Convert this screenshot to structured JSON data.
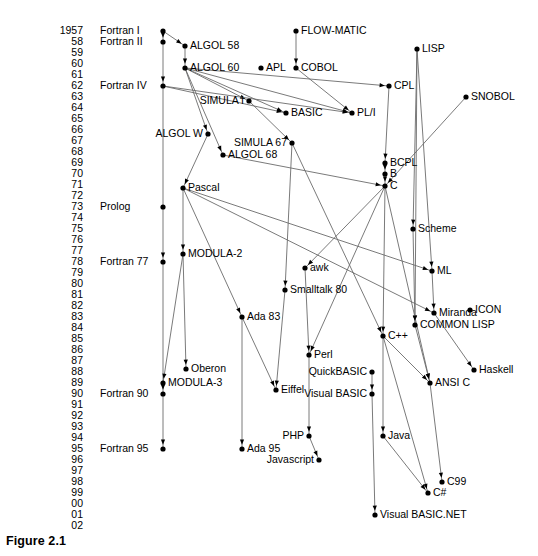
{
  "figure": {
    "caption": "Figure 2.1",
    "width": 538,
    "height": 556,
    "ink_color": "#000000",
    "line_color": "#6b6b6b",
    "background": "#ffffff"
  },
  "chart_data": {
    "type": "diagram",
    "title": "Figure 2.1",
    "subtype": "programming-language genealogy timeline",
    "ylabel": "Year",
    "years": [
      "1957",
      "58",
      "59",
      "60",
      "61",
      "62",
      "63",
      "64",
      "65",
      "66",
      "67",
      "68",
      "69",
      "70",
      "71",
      "72",
      "73",
      "74",
      "75",
      "76",
      "77",
      "78",
      "79",
      "80",
      "81",
      "82",
      "83",
      "84",
      "85",
      "86",
      "87",
      "88",
      "89",
      "90",
      "91",
      "92",
      "93",
      "94",
      "95",
      "96",
      "97",
      "98",
      "99",
      "00",
      "01",
      "02"
    ],
    "year_rows": [
      {
        "year": "1957",
        "y": 31
      },
      {
        "year": "58",
        "y": 42
      },
      {
        "year": "59",
        "y": 53
      },
      {
        "year": "60",
        "y": 64
      },
      {
        "year": "61",
        "y": 75
      },
      {
        "year": "62",
        "y": 86
      },
      {
        "year": "63",
        "y": 97
      },
      {
        "year": "64",
        "y": 108
      },
      {
        "year": "65",
        "y": 119
      },
      {
        "year": "66",
        "y": 130
      },
      {
        "year": "67",
        "y": 141
      },
      {
        "year": "68",
        "y": 152
      },
      {
        "year": "69",
        "y": 163
      },
      {
        "year": "70",
        "y": 174
      },
      {
        "year": "71",
        "y": 185
      },
      {
        "year": "72",
        "y": 196
      },
      {
        "year": "73",
        "y": 207
      },
      {
        "year": "74",
        "y": 218
      },
      {
        "year": "75",
        "y": 229
      },
      {
        "year": "76",
        "y": 240
      },
      {
        "year": "77",
        "y": 251
      },
      {
        "year": "78",
        "y": 262
      },
      {
        "year": "79",
        "y": 273
      },
      {
        "year": "80",
        "y": 284
      },
      {
        "year": "81",
        "y": 295
      },
      {
        "year": "82",
        "y": 306
      },
      {
        "year": "83",
        "y": 317
      },
      {
        "year": "84",
        "y": 328
      },
      {
        "year": "85",
        "y": 339
      },
      {
        "year": "86",
        "y": 350
      },
      {
        "year": "87",
        "y": 361
      },
      {
        "year": "88",
        "y": 372
      },
      {
        "year": "89",
        "y": 383
      },
      {
        "year": "90",
        "y": 394
      },
      {
        "year": "91",
        "y": 405
      },
      {
        "year": "92",
        "y": 416
      },
      {
        "year": "93",
        "y": 427
      },
      {
        "year": "94",
        "y": 438
      },
      {
        "year": "95",
        "y": 449
      },
      {
        "year": "96",
        "y": 460
      },
      {
        "year": "97",
        "y": 471
      },
      {
        "year": "98",
        "y": 482
      },
      {
        "year": "99",
        "y": 493
      },
      {
        "year": "00",
        "y": 504
      },
      {
        "year": "01",
        "y": 515
      },
      {
        "year": "02",
        "y": 526
      }
    ],
    "era_labels": [
      {
        "text": "Fortran I",
        "x": 100,
        "y": 31
      },
      {
        "text": "Fortran II",
        "x": 100,
        "y": 42
      },
      {
        "text": "Fortran IV",
        "x": 100,
        "y": 86
      },
      {
        "text": "Prolog",
        "x": 100,
        "y": 207
      },
      {
        "text": "Fortran 77",
        "x": 100,
        "y": 262
      },
      {
        "text": "Fortran 90",
        "x": 100,
        "y": 394
      },
      {
        "text": "Fortran 95",
        "x": 100,
        "y": 449
      }
    ],
    "nodes": [
      {
        "id": "fortran1",
        "label": "Fortran I",
        "x": 163,
        "y": 31,
        "label_pos": "none"
      },
      {
        "id": "fortran2",
        "label": "Fortran II",
        "x": 163,
        "y": 42,
        "label_pos": "none"
      },
      {
        "id": "fortran4",
        "label": "Fortran IV",
        "x": 163,
        "y": 86,
        "label_pos": "none"
      },
      {
        "id": "fortran77",
        "label": "Fortran 77",
        "x": 163,
        "y": 262,
        "label_pos": "none"
      },
      {
        "id": "fortran90",
        "label": "Fortran 90",
        "x": 163,
        "y": 394,
        "label_pos": "none"
      },
      {
        "id": "fortran95",
        "label": "Fortran 95",
        "x": 163,
        "y": 449,
        "label_pos": "none"
      },
      {
        "id": "algol58",
        "label": "ALGOL 58",
        "x": 185,
        "y": 46,
        "label_pos": "right"
      },
      {
        "id": "algol60",
        "label": "ALGOL 60",
        "x": 185,
        "y": 68,
        "label_pos": "right"
      },
      {
        "id": "apl",
        "label": "APL",
        "x": 261,
        "y": 68,
        "label_pos": "right"
      },
      {
        "id": "flowmatic",
        "label": "FLOW-MATIC",
        "x": 296,
        "y": 31,
        "label_pos": "right"
      },
      {
        "id": "cobol",
        "label": "COBOL",
        "x": 296,
        "y": 68,
        "label_pos": "right"
      },
      {
        "id": "lisp",
        "label": "LISP",
        "x": 417,
        "y": 49,
        "label_pos": "right"
      },
      {
        "id": "cpl",
        "label": "CPL",
        "x": 389,
        "y": 86,
        "label_pos": "right"
      },
      {
        "id": "snobol",
        "label": "SNOBOL",
        "x": 466,
        "y": 97,
        "label_pos": "right"
      },
      {
        "id": "simula1",
        "label": "SIMULA I",
        "x": 249,
        "y": 101,
        "label_pos": "left"
      },
      {
        "id": "basic",
        "label": "BASIC",
        "x": 286,
        "y": 113,
        "label_pos": "right"
      },
      {
        "id": "pli",
        "label": "PL/I",
        "x": 352,
        "y": 113,
        "label_pos": "right"
      },
      {
        "id": "algolw",
        "label": "ALGOL W",
        "x": 208,
        "y": 134,
        "label_pos": "left"
      },
      {
        "id": "simula67",
        "label": "SIMULA 67",
        "x": 292,
        "y": 143,
        "label_pos": "left"
      },
      {
        "id": "algol68",
        "label": "ALGOL 68",
        "x": 223,
        "y": 155,
        "label_pos": "right"
      },
      {
        "id": "bcpl",
        "label": "BCPL",
        "x": 385,
        "y": 163,
        "label_pos": "right"
      },
      {
        "id": "b",
        "label": "B",
        "x": 385,
        "y": 174,
        "label_pos": "right"
      },
      {
        "id": "c",
        "label": "C",
        "x": 385,
        "y": 186,
        "label_pos": "right"
      },
      {
        "id": "pascal",
        "label": "Pascal",
        "x": 183,
        "y": 188,
        "label_pos": "right"
      },
      {
        "id": "prolog",
        "label": "Prolog",
        "x": 163,
        "y": 207,
        "label_pos": "none"
      },
      {
        "id": "scheme",
        "label": "Scheme",
        "x": 413,
        "y": 229,
        "label_pos": "right"
      },
      {
        "id": "modula2",
        "label": "MODULA-2",
        "x": 183,
        "y": 254,
        "label_pos": "right"
      },
      {
        "id": "ml",
        "label": "ML",
        "x": 432,
        "y": 271,
        "label_pos": "right"
      },
      {
        "id": "awk",
        "label": "awk",
        "x": 305,
        "y": 268,
        "label_pos": "right"
      },
      {
        "id": "smalltalk",
        "label": "Smalltalk 80",
        "x": 285,
        "y": 290,
        "label_pos": "right"
      },
      {
        "id": "miranda",
        "label": "Miranda",
        "x": 434,
        "y": 313,
        "label_pos": "right"
      },
      {
        "id": "icon",
        "label": "ICON",
        "x": 470,
        "y": 310,
        "label_pos": "right"
      },
      {
        "id": "commonlisp",
        "label": "COMMON LISP",
        "x": 415,
        "y": 325,
        "label_pos": "right"
      },
      {
        "id": "ada83",
        "label": "Ada 83",
        "x": 242,
        "y": 317,
        "label_pos": "right"
      },
      {
        "id": "cpp",
        "label": "C++",
        "x": 383,
        "y": 336,
        "label_pos": "right"
      },
      {
        "id": "perl",
        "label": "Perl",
        "x": 309,
        "y": 355,
        "label_pos": "right"
      },
      {
        "id": "quickbasic",
        "label": "QuickBASIC",
        "x": 372,
        "y": 372,
        "label_pos": "left"
      },
      {
        "id": "oberon",
        "label": "Oberon",
        "x": 186,
        "y": 369,
        "label_pos": "right"
      },
      {
        "id": "haskell",
        "label": "Haskell",
        "x": 474,
        "y": 370,
        "label_pos": "right"
      },
      {
        "id": "modula3",
        "label": "MODULA-3",
        "x": 163,
        "y": 383,
        "label_pos": "right"
      },
      {
        "id": "ansic",
        "label": "ANSI C",
        "x": 430,
        "y": 383,
        "label_pos": "right"
      },
      {
        "id": "eiffel",
        "label": "Eiffel",
        "x": 276,
        "y": 390,
        "label_pos": "right"
      },
      {
        "id": "visualbasic",
        "label": "Visual BASIC",
        "x": 372,
        "y": 394,
        "label_pos": "left"
      },
      {
        "id": "java",
        "label": "Java",
        "x": 383,
        "y": 436,
        "label_pos": "right"
      },
      {
        "id": "php",
        "label": "PHP",
        "x": 309,
        "y": 436,
        "label_pos": "left"
      },
      {
        "id": "ada95",
        "label": "Ada 95",
        "x": 242,
        "y": 449,
        "label_pos": "right"
      },
      {
        "id": "javascript",
        "label": "Javascript",
        "x": 319,
        "y": 460,
        "label_pos": "left"
      },
      {
        "id": "c99",
        "label": "C99",
        "x": 442,
        "y": 482,
        "label_pos": "right"
      },
      {
        "id": "csharp",
        "label": "C#",
        "x": 428,
        "y": 493,
        "label_pos": "right"
      },
      {
        "id": "vbnet",
        "label": "Visual BASIC.NET",
        "x": 375,
        "y": 515,
        "label_pos": "right"
      }
    ],
    "edges": [
      {
        "from": "fortran1",
        "to": "fortran2"
      },
      {
        "from": "fortran2",
        "to": "fortran4"
      },
      {
        "from": "fortran4",
        "to": "fortran77"
      },
      {
        "from": "fortran77",
        "to": "fortran90"
      },
      {
        "from": "fortran90",
        "to": "fortran95"
      },
      {
        "from": "fortran1",
        "to": "algol58"
      },
      {
        "from": "algol58",
        "to": "algol60"
      },
      {
        "from": "algol60",
        "to": "simula1"
      },
      {
        "from": "algol60",
        "to": "basic"
      },
      {
        "from": "algol60",
        "to": "pli"
      },
      {
        "from": "algol60",
        "to": "algolw"
      },
      {
        "from": "algol60",
        "to": "algol68"
      },
      {
        "from": "algol60",
        "to": "cpl"
      },
      {
        "from": "fortran4",
        "to": "basic"
      },
      {
        "from": "fortran4",
        "to": "pli"
      },
      {
        "from": "cobol",
        "to": "pli"
      },
      {
        "from": "flowmatic",
        "to": "cobol"
      },
      {
        "from": "simula1",
        "to": "simula67"
      },
      {
        "from": "algolw",
        "to": "pascal"
      },
      {
        "from": "cpl",
        "to": "bcpl"
      },
      {
        "from": "bcpl",
        "to": "b"
      },
      {
        "from": "b",
        "to": "c"
      },
      {
        "from": "snobol",
        "to": "c"
      },
      {
        "from": "lisp",
        "to": "scheme"
      },
      {
        "from": "lisp",
        "to": "ml"
      },
      {
        "from": "lisp",
        "to": "commonlisp"
      },
      {
        "from": "pascal",
        "to": "modula2"
      },
      {
        "from": "pascal",
        "to": "ada83"
      },
      {
        "from": "pascal",
        "to": "ml"
      },
      {
        "from": "pascal",
        "to": "miranda"
      },
      {
        "from": "simula67",
        "to": "smalltalk"
      },
      {
        "from": "simula67",
        "to": "cpp"
      },
      {
        "from": "algol68",
        "to": "c"
      },
      {
        "from": "c",
        "to": "awk"
      },
      {
        "from": "c",
        "to": "cpp"
      },
      {
        "from": "c",
        "to": "ansic"
      },
      {
        "from": "c",
        "to": "perl"
      },
      {
        "from": "modula2",
        "to": "oberon"
      },
      {
        "from": "modula2",
        "to": "modula3"
      },
      {
        "from": "scheme",
        "to": "commonlisp"
      },
      {
        "from": "ml",
        "to": "miranda"
      },
      {
        "from": "miranda",
        "to": "haskell"
      },
      {
        "from": "commonlisp",
        "to": "ansic"
      },
      {
        "from": "ada83",
        "to": "eiffel"
      },
      {
        "from": "ada83",
        "to": "ada95"
      },
      {
        "from": "awk",
        "to": "perl"
      },
      {
        "from": "perl",
        "to": "php"
      },
      {
        "from": "smalltalk",
        "to": "eiffel"
      },
      {
        "from": "cpp",
        "to": "java"
      },
      {
        "from": "cpp",
        "to": "ansic"
      },
      {
        "from": "cpp",
        "to": "csharp"
      },
      {
        "from": "quickbasic",
        "to": "visualbasic"
      },
      {
        "from": "visualbasic",
        "to": "vbnet"
      },
      {
        "from": "java",
        "to": "csharp"
      },
      {
        "from": "ansic",
        "to": "c99"
      },
      {
        "from": "php",
        "to": "javascript"
      }
    ]
  }
}
